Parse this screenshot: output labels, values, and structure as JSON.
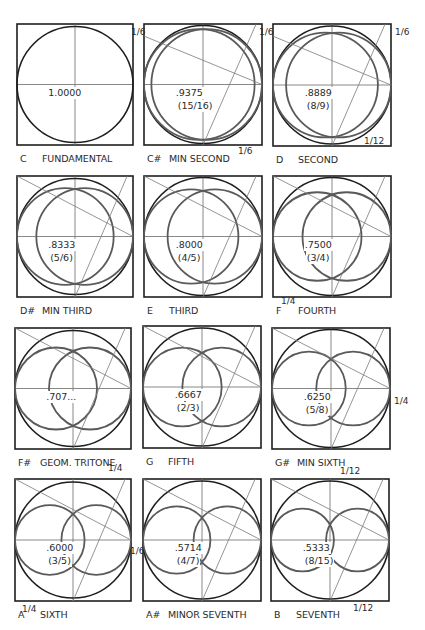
{
  "colors": {
    "outline": "#1e1e1e",
    "circle": "#5a5a5a",
    "guide": "#7a7a7a",
    "background": "#ffffff"
  },
  "cells": [
    {
      "note": "C",
      "name": "FUNDAMENTAL",
      "value": "1.0000",
      "fraction": "",
      "ratio": 1.0,
      "box": [
        17,
        24,
        116,
        121
      ]
    },
    {
      "note": "C#",
      "name": "MIN SECOND",
      "value": ".9375",
      "fraction": "(15/16)",
      "ratio": 0.9375,
      "box": [
        144,
        24,
        118,
        121
      ]
    },
    {
      "note": "D",
      "name": "SECOND",
      "value": ".8889",
      "fraction": "(8/9)",
      "ratio": 0.8889,
      "box": [
        273,
        24,
        118,
        122
      ]
    },
    {
      "note": "D#",
      "name": "MIN THIRD",
      "value": ".8333",
      "fraction": "(5/6)",
      "ratio": 0.8333,
      "box": [
        17,
        176,
        116,
        121
      ]
    },
    {
      "note": "E",
      "name": "THIRD",
      "value": ".8000",
      "fraction": "(4/5)",
      "ratio": 0.8,
      "box": [
        144,
        176,
        118,
        121
      ]
    },
    {
      "note": "F",
      "name": "FOURTH",
      "value": ".7500",
      "fraction": "(3/4)",
      "ratio": 0.75,
      "box": [
        273,
        176,
        118,
        121
      ]
    },
    {
      "note": "F#",
      "name": "GEOM. TRITONE",
      "value": ".707...",
      "fraction": "",
      "ratio": 0.7071,
      "box": [
        15,
        328,
        116,
        121
      ]
    },
    {
      "note": "G",
      "name": "FIFTH",
      "value": ".6667",
      "fraction": "(2/3)",
      "ratio": 0.6667,
      "box": [
        143,
        326,
        118,
        122
      ]
    },
    {
      "note": "G#",
      "name": "MIN SIXTH",
      "value": ".6250",
      "fraction": "(5/8)",
      "ratio": 0.625,
      "box": [
        272,
        328,
        118,
        121
      ]
    },
    {
      "note": "A",
      "name": "SIXTH",
      "value": ".6000",
      "fraction": "(3/5)",
      "ratio": 0.6,
      "box": [
        15,
        479,
        116,
        122
      ]
    },
    {
      "note": "A#",
      "name": "MINOR SEVENTH",
      "value": ".5714",
      "fraction": "(4/7)",
      "ratio": 0.5714,
      "box": [
        143,
        479,
        118,
        122
      ]
    },
    {
      "note": "B",
      "name": "SEVENTH",
      "value": ".5333",
      "fraction": "(8/15)",
      "ratio": 0.5333,
      "box": [
        271,
        479,
        118,
        122
      ]
    }
  ],
  "dimension_marks": [
    {
      "text": "1/6",
      "x": 131,
      "y": 27
    },
    {
      "text": "1/6",
      "x": 259,
      "y": 27
    },
    {
      "text": "1/6",
      "x": 395,
      "y": 27
    },
    {
      "text": "1/6",
      "x": 238,
      "y": 146
    },
    {
      "text": "1/12",
      "x": 364,
      "y": 136
    },
    {
      "text": "1/4",
      "x": 281,
      "y": 296
    },
    {
      "text": "1/4",
      "x": 394,
      "y": 396
    },
    {
      "text": "1/4",
      "x": 108,
      "y": 463
    },
    {
      "text": "1/6",
      "x": 130,
      "y": 546
    },
    {
      "text": "1/4",
      "x": 22,
      "y": 604
    },
    {
      "text": "1/12",
      "x": 340,
      "y": 466
    },
    {
      "text": "1/12",
      "x": 353,
      "y": 603
    }
  ]
}
